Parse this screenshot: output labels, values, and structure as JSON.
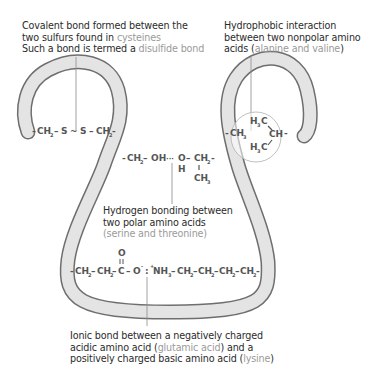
{
  "colors": {
    "tube_fill": "#e4e4e4",
    "tube_outline": "#6e6e6e",
    "text": "#2b2b2b",
    "highlight_text": "#9a9a9a",
    "chem_text": "#555555",
    "leader_line": "#8a8a8a"
  },
  "captions": {
    "disulfide": {
      "line1": "Covalent bond formed between the",
      "line2_prefix": "two sulfurs found in ",
      "line2_highlight": "cysteines",
      "line3_prefix": "Such a bond is termed a ",
      "line3_highlight": "disulfide bond"
    },
    "hydrophobic": {
      "line1": "Hydrophobic interaction",
      "line2": "between two nonpolar amino",
      "line3_prefix": "acids (",
      "line3_highlight": "alanine and valine",
      "line3_suffix": ")"
    },
    "hydrogen": {
      "line1": "Hydrogen bonding between",
      "line2": "two polar amino acids",
      "line3_prefix": "(",
      "line3_highlight": "serine and threonine",
      "line3_suffix": ")"
    },
    "ionic": {
      "line1": "Ionic bond between a negatively charged",
      "line2_prefix": "acidic amino acid (",
      "line2_highlight": "glutamic acid",
      "line2_suffix": ") and a",
      "line3_prefix": "positively charged basic amino acid (",
      "line3_highlight": "lysine",
      "line3_suffix": ")"
    }
  },
  "chemistry": {
    "disulfide": {
      "left": "CH",
      "left_sub": "2",
      "s1": "S",
      "s2": "S",
      "right": "CH",
      "right_sub": "2"
    },
    "hydrophobic": {
      "left": "CH",
      "left_sub": "3",
      "top": "H",
      "top_sub": "3",
      "top_c": "C",
      "bottom": "H",
      "bottom_sub": "3",
      "bottom_c": "C",
      "right": "CH"
    },
    "hydrogen": {
      "left": "CH",
      "left_sub": "2",
      "oh": "OH",
      "o": "O",
      "h": "H",
      "ch2": "CH",
      "ch2_sub": "2",
      "ch3": "CH",
      "ch3_sub": "3"
    },
    "ionic": {
      "ch2a": "CH",
      "ch2b": "CH",
      "sub2": "2",
      "c": "C",
      "o_top": "O",
      "o_minus": "O",
      "minus": "-",
      "plus": "+",
      "nh3": "NH",
      "nh3_sub": "3",
      "ch2c": "CH",
      "ch2d": "CH",
      "ch2e": "CH",
      "ch2f": "CH"
    }
  }
}
